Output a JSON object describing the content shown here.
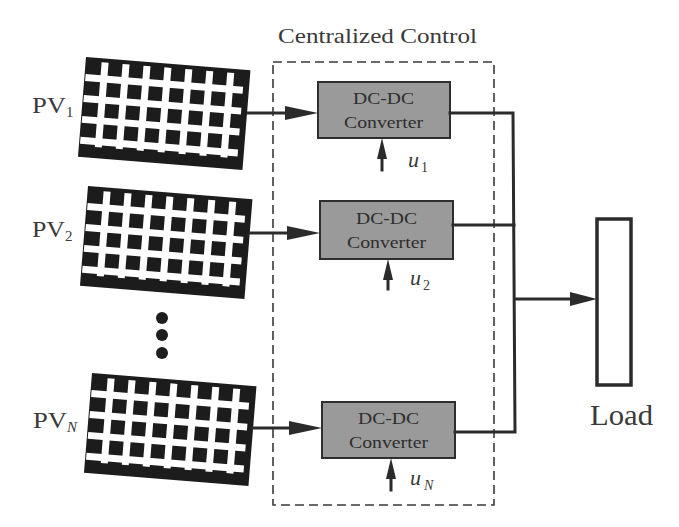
{
  "diagram": {
    "title": "Centralized Control",
    "pv_panels": [
      {
        "label": "PV",
        "subscript": "1"
      },
      {
        "label": "PV",
        "subscript": "2"
      },
      {
        "label": "PV",
        "subscript": "N"
      }
    ],
    "ellipsis": "vertical-dots",
    "converters": [
      {
        "line1": "DC-DC",
        "line2": "Converter",
        "control_label": "u",
        "control_subscript": "1"
      },
      {
        "line1": "DC-DC",
        "line2": "Converter",
        "control_label": "u",
        "control_subscript": "2"
      },
      {
        "line1": "DC-DC",
        "line2": "Converter",
        "control_label": "u",
        "control_subscript": "N"
      }
    ],
    "load": {
      "label": "Load"
    }
  },
  "colors": {
    "converter_fill": "#9a9a9a",
    "panel_fill": "#1c1c1c",
    "wire": "#2b2b2b",
    "background": "#ffffff"
  }
}
